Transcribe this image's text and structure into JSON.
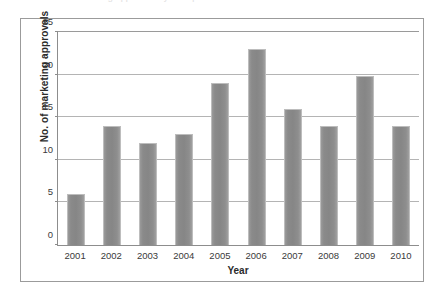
{
  "caption": {
    "text": "marketing approvals by therapeutic area"
  },
  "chart_data": {
    "type": "bar",
    "title": "",
    "subtitle": "",
    "xlabel": "Year",
    "ylabel": "No. of marketing approvals",
    "categories": [
      "2001",
      "2002",
      "2003",
      "2004",
      "2005",
      "2006",
      "2007",
      "2008",
      "2009",
      "2010"
    ],
    "values": [
      6,
      14,
      12,
      13,
      19,
      23,
      16,
      14,
      19.8,
      14
    ],
    "ylim": [
      0,
      25
    ],
    "ytick_labels": [
      "0",
      "5",
      "10",
      "15",
      "20",
      "25"
    ],
    "ytick_values": [
      0,
      5,
      10,
      15,
      20,
      25
    ],
    "grid": true,
    "legend": null,
    "bar_color": "#8c8c8c",
    "axis_color": "#8d8d8d",
    "gridline_color": "#b4b4b4",
    "frame_color": "#9b9b9b"
  }
}
